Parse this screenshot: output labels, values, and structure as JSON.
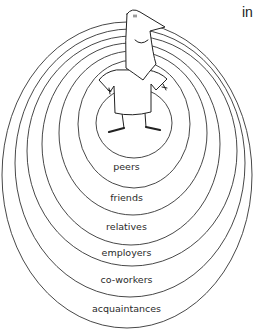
{
  "corner_text": "in",
  "rings": [
    {
      "label": "peers"
    },
    {
      "label": "friends"
    },
    {
      "label": "relatives"
    },
    {
      "label": "employers"
    },
    {
      "label": "co-workers"
    },
    {
      "label": "acquaintances"
    }
  ],
  "figure": "cartoon-person-hands-on-hips",
  "colors": {
    "line": "#333333",
    "background": "#ffffff"
  }
}
